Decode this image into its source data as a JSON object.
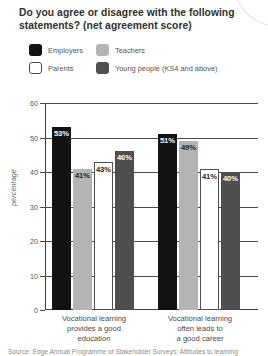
{
  "title": "Do you agree or disagree  with the following statements? (net agreement score)",
  "legend": {
    "items": [
      {
        "label": "Employers",
        "color": "#121212",
        "swatch": "employers"
      },
      {
        "label": "Teachers",
        "color": "#b4b4b4",
        "swatch": "teachers"
      },
      {
        "label": "Parents",
        "color": "#ffffff",
        "swatch": "parents"
      },
      {
        "label": "Young people (KS4 and above)",
        "color": "#4f4f4f",
        "swatch": "young"
      }
    ]
  },
  "source": "Source: Edge Annual Programme of Stakeholder Surveys: Attitudes to learning",
  "chart_data": {
    "type": "bar",
    "title": "Do you agree or disagree  with the following statements? (net agreement score)",
    "xlabel": "",
    "ylabel": "percentage",
    "ylim": [
      0,
      60
    ],
    "yticks": [
      0,
      10,
      20,
      30,
      40,
      50,
      60
    ],
    "ytick_labels": [
      "0",
      "10",
      "20",
      "30",
      "40",
      "50",
      "60"
    ],
    "grid": true,
    "legend_position": "top-left",
    "categories": [
      "Vocational learning provides a good education",
      "Vocational learning often leads to a good career"
    ],
    "category_lines": [
      [
        "Vocational learning",
        "provides a good",
        "education"
      ],
      [
        "Vocational learning",
        "often leads to",
        "a good career"
      ]
    ],
    "series": [
      {
        "name": "Employers",
        "color": "#121212",
        "values": [
          53,
          51
        ],
        "labels": [
          "53%",
          "51%"
        ]
      },
      {
        "name": "Teachers",
        "color": "#b4b4b4",
        "values": [
          41,
          49
        ],
        "labels": [
          "41%",
          "49%"
        ]
      },
      {
        "name": "Parents",
        "color": "#ffffff",
        "values": [
          43,
          41
        ],
        "labels": [
          "43%",
          "41%"
        ]
      },
      {
        "name": "Young people (KS4 and above)",
        "color": "#4f4f4f",
        "values": [
          46,
          40
        ],
        "labels": [
          "46%",
          "40%"
        ]
      }
    ]
  }
}
